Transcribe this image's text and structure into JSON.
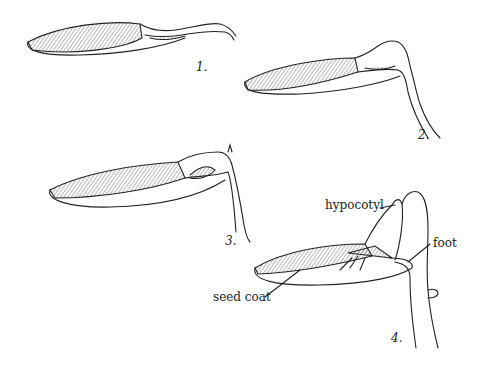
{
  "figure": {
    "stages": [
      {
        "number": "1."
      },
      {
        "number": "2."
      },
      {
        "number": "3."
      },
      {
        "number": "4."
      }
    ],
    "labels": {
      "hypocotyl": "hypocotyl",
      "foot": "foot",
      "seed_coat": "seed coat"
    }
  }
}
